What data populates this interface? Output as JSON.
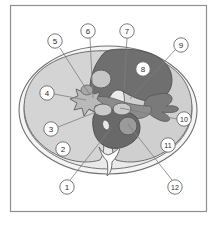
{
  "figure": {
    "frame": {
      "border_color": "#8a8a8a",
      "background_color": "#ffffff"
    },
    "palette": {
      "outline": "#6e6e6e",
      "capsule_fill": "#f2f2f2",
      "parenchyma_light": "#d2d2d2",
      "parenchyma_mid": "#b4b4b4",
      "hilum_dark": "#6a6a6a",
      "vessel_dark": "#575757",
      "vessel_light": "#c8c8c8",
      "bone_fill": "#fafafa",
      "label_circle_fill": "#ffffff",
      "label_text": "#2b2b2b",
      "leader_line": "#7a7a7a"
    },
    "callouts": [
      {
        "id": "callout-1",
        "number": "1",
        "cx": 67,
        "cy": 187,
        "tip_x": 112,
        "tip_y": 127
      },
      {
        "id": "callout-2",
        "number": "2",
        "cx": 63,
        "cy": 149,
        "tip_x": 63,
        "tip_y": 149
      },
      {
        "id": "callout-3",
        "number": "3",
        "cx": 51,
        "cy": 129,
        "tip_x": 96,
        "tip_y": 112
      },
      {
        "id": "callout-4",
        "number": "4",
        "cx": 47,
        "cy": 93,
        "tip_x": 86,
        "tip_y": 100
      },
      {
        "id": "callout-5",
        "number": "5",
        "cx": 55,
        "cy": 41,
        "tip_x": 90,
        "tip_y": 95
      },
      {
        "id": "callout-6",
        "number": "6",
        "cx": 88,
        "cy": 31,
        "tip_x": 92,
        "tip_y": 97
      },
      {
        "id": "callout-7",
        "number": "7",
        "cx": 127,
        "cy": 31,
        "tip_x": 124,
        "tip_y": 90
      },
      {
        "id": "callout-8",
        "number": "8",
        "cx": 143,
        "cy": 69,
        "tip_x": 143,
        "tip_y": 69
      },
      {
        "id": "callout-9",
        "number": "9",
        "cx": 181,
        "cy": 45,
        "tip_x": 130,
        "tip_y": 99
      },
      {
        "id": "callout-10",
        "number": "10",
        "cx": 184,
        "cy": 119,
        "tip_x": 120,
        "tip_y": 108
      },
      {
        "id": "callout-11",
        "number": "11",
        "cx": 168,
        "cy": 145,
        "tip_x": 168,
        "tip_y": 145
      },
      {
        "id": "callout-12",
        "number": "12",
        "cx": 175,
        "cy": 187,
        "tip_x": 128,
        "tip_y": 124
      }
    ]
  }
}
